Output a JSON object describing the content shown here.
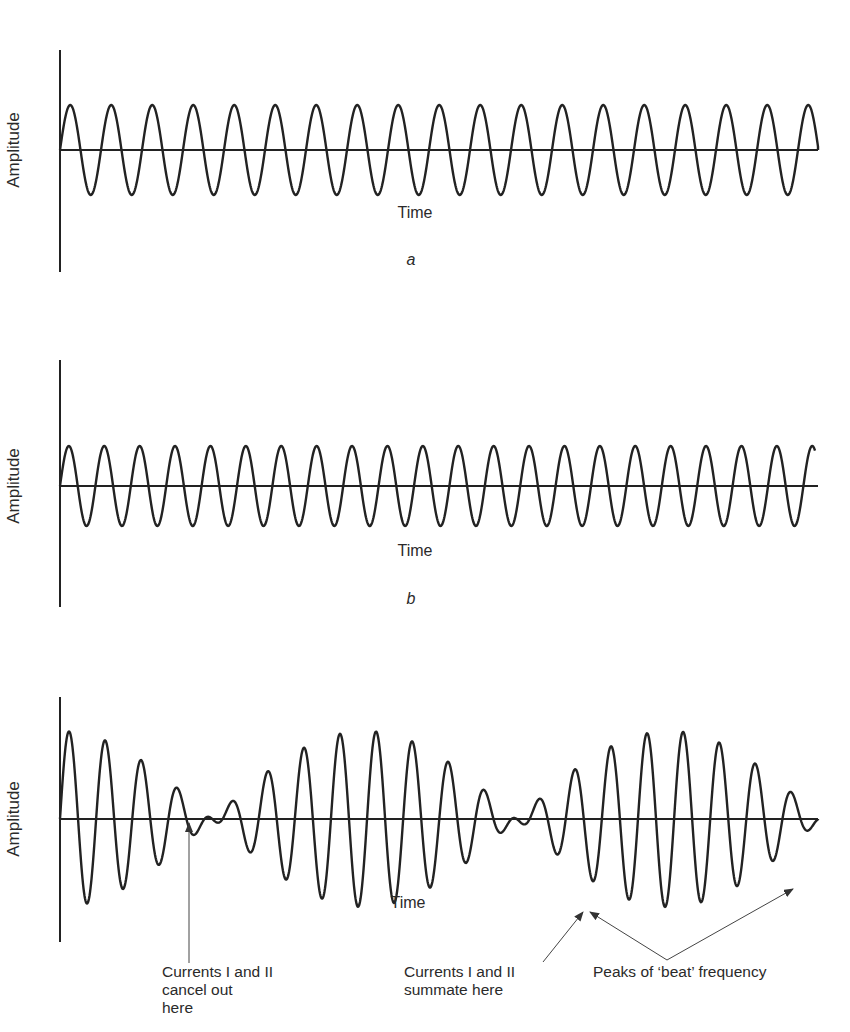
{
  "header": {
    "fragment": ""
  },
  "panels": [
    {
      "id": "a",
      "label": "a",
      "ylabel": "Amplitude",
      "xlabel": "Time",
      "axis": {
        "x0": 60,
        "x1": 818,
        "y_top": 50,
        "y_bottom": 272,
        "baseline": 150
      },
      "xlabel_pos": [
        415,
        218
      ],
      "panel_label_pos": [
        411,
        265
      ],
      "wave": {
        "type": "sine",
        "amplitude": 45,
        "period": 41.0,
        "x_start": 60,
        "x_end": 818
      }
    },
    {
      "id": "b",
      "label": "b",
      "ylabel": "Amplitude",
      "xlabel": "Time",
      "axis": {
        "x0": 60,
        "x1": 818,
        "y_top": 360,
        "y_bottom": 607,
        "baseline": 486
      },
      "xlabel_pos": [
        415,
        556
      ],
      "panel_label_pos": [
        411,
        604
      ],
      "wave": {
        "type": "sine",
        "amplitude": 40,
        "period": 35.4,
        "x_start": 60,
        "x_end": 815
      }
    },
    {
      "id": "c",
      "label": "",
      "ylabel": "Amplitude",
      "xlabel": "Time",
      "axis": {
        "x0": 60,
        "x1": 818,
        "y_top": 697,
        "y_bottom": 942,
        "baseline": 819
      },
      "xlabel_pos": [
        408,
        908
      ],
      "wave": {
        "type": "sum",
        "components": [
          {
            "amplitude": 44,
            "period": 38.4
          },
          {
            "amplitude": 44,
            "period": 34.1
          }
        ],
        "x_start": 60,
        "x_end": 818
      }
    }
  ],
  "annotations": [
    {
      "id": "cancel",
      "lines": [
        "Currents I and II",
        "cancel out",
        "here"
      ],
      "x": 162,
      "y": 977
    },
    {
      "id": "summate",
      "lines": [
        "Currents I and II",
        "summate here"
      ],
      "x": 404,
      "y": 977
    },
    {
      "id": "beat",
      "lines": [
        "Peaks of ‘beat’ frequency"
      ],
      "x": 593,
      "y": 977
    }
  ],
  "arrows": [
    {
      "from": [
        189,
        963
      ],
      "to": [
        189,
        823
      ]
    },
    {
      "from": [
        543,
        962
      ],
      "to": [
        583,
        912
      ]
    },
    {
      "from": [
        667,
        960
      ],
      "to": [
        590,
        912
      ]
    },
    {
      "from": [
        667,
        960
      ],
      "to": [
        793,
        889
      ]
    }
  ],
  "chart_data": [
    {
      "type": "line",
      "title": "a",
      "xlabel": "Time",
      "ylabel": "Amplitude",
      "description": "Pure sine wave, current I, ~18.5 cycles, constant amplitude",
      "series": [
        {
          "name": "Current I",
          "cycles": 18.5,
          "relative_amplitude": 1.0
        }
      ]
    },
    {
      "type": "line",
      "title": "b",
      "xlabel": "Time",
      "ylabel": "Amplitude",
      "description": "Pure sine wave, current II, slightly higher frequency, ~21.3 cycles",
      "series": [
        {
          "name": "Current II",
          "cycles": 21.3,
          "relative_amplitude": 0.9
        }
      ]
    },
    {
      "type": "line",
      "title": "",
      "xlabel": "Time",
      "ylabel": "Amplitude",
      "description": "Sum of currents I and II producing beat (interference) pattern",
      "series": [
        {
          "name": "I + II",
          "beat_maxima_x_fraction": [
            0.0,
            0.34,
            0.69,
            1.0
          ],
          "beat_minima_x_fraction": [
            0.17,
            0.51,
            0.85
          ]
        }
      ],
      "annotations": [
        "Currents I and II cancel out here",
        "Currents I and II summate here",
        "Peaks of ‘beat’ frequency"
      ]
    }
  ]
}
